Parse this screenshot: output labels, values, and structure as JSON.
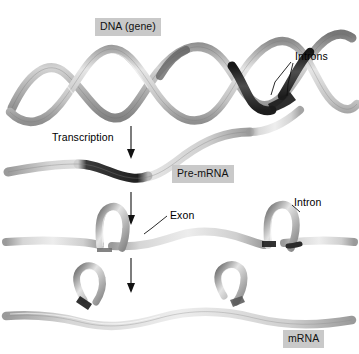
{
  "figure": {
    "background_color": "#ffffff",
    "label_box_color": "#c9c9c9",
    "text_color": "#000000",
    "width": 359,
    "height": 354
  },
  "labels": {
    "dna_gene": "DNA (gene)",
    "introns_plural": "Introns",
    "transcription": "Transcription",
    "pre_mrna": "Pre-mRNA",
    "exon": "Exon",
    "intron_singular": "Intron",
    "mrna": "mRNA"
  },
  "stages": [
    {
      "name": "dna-helix",
      "label": "DNA (gene)",
      "description": "Double-helix ribbon with dark intron segments",
      "annotation": "Introns"
    },
    {
      "name": "pre-mrna-strand",
      "label": "Pre-mRNA",
      "description": "Single wavy ribbon containing dark intron regions"
    },
    {
      "name": "looping-strand",
      "label": "",
      "description": "Introns loop out of the strand",
      "annotations": [
        "Exon",
        "Intron"
      ]
    },
    {
      "name": "excised-introns",
      "label": "",
      "description": "Two excised intron lariat loops released above the strand"
    },
    {
      "name": "mature-mrna",
      "label": "mRNA",
      "description": "Smooth spliced ribbon of joined exons"
    }
  ],
  "arrows": [
    {
      "name": "transcription-arrow",
      "label": "Transcription"
    },
    {
      "name": "splicing-arrow-1",
      "label": ""
    },
    {
      "name": "splicing-arrow-2",
      "label": ""
    }
  ],
  "colors": {
    "ribbon_light": "#d9d9d9",
    "ribbon_mid": "#a8a8a8",
    "ribbon_dark": "#3a3a3a",
    "outline": "#6b6b6b"
  }
}
